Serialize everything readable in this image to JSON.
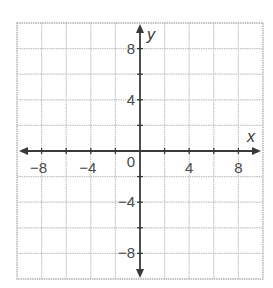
{
  "chart_data": {
    "type": "coordinate-plane",
    "title": "",
    "xlabel": "x",
    "ylabel": "y",
    "xlim": [
      -10,
      10
    ],
    "ylim": [
      -10,
      10
    ],
    "grid": true,
    "grid_step": 2,
    "x_tick_labels": [
      {
        "value": -8,
        "text": "−8"
      },
      {
        "value": -4,
        "text": "−4"
      },
      {
        "value": 0,
        "text": "0"
      },
      {
        "value": 4,
        "text": "4"
      },
      {
        "value": 8,
        "text": "8"
      }
    ],
    "y_tick_labels": [
      {
        "value": 8,
        "text": "8"
      },
      {
        "value": 4,
        "text": "4"
      },
      {
        "value": -4,
        "text": "−4"
      },
      {
        "value": -8,
        "text": "−8"
      }
    ],
    "series": [],
    "colors": {
      "grid": "#c4c4c4",
      "axis": "#3a3a3a",
      "text": "#4a4a4a"
    }
  }
}
